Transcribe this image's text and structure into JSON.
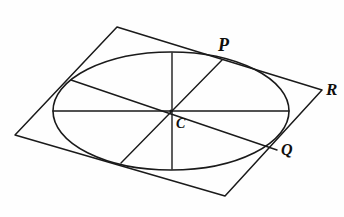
{
  "figure": {
    "kind": "geometry-diagram",
    "background_color": "#fefefe",
    "ink_color": "#1a1a1a",
    "labels": [
      {
        "id": "P",
        "text": "P",
        "role": "point-on-ellipse",
        "x": 222,
        "y": 60
      },
      {
        "id": "R",
        "text": "R",
        "role": "parallelogram-vertex",
        "x": 322,
        "y": 90
      },
      {
        "id": "Q",
        "text": "Q",
        "role": "point-on-ellipse",
        "x": 277,
        "y": 150
      },
      {
        "id": "C",
        "text": "C",
        "role": "ellipse-centre",
        "x": 171,
        "y": 111
      }
    ],
    "parallelogram": {
      "name": "circumscribing-parallelogram",
      "vertices": [
        {
          "x": 117,
          "y": 27
        },
        {
          "x": 322,
          "y": 90
        },
        {
          "x": 225,
          "y": 196
        },
        {
          "x": 15,
          "y": 135
        }
      ]
    },
    "ellipse": {
      "name": "inscribed-ellipse",
      "cx": 171,
      "cy": 111,
      "rx": 118,
      "ry": 59
    },
    "diameters": [
      {
        "name": "horizontal-diameter",
        "x1": 53,
        "y1": 111,
        "x2": 289,
        "y2": 111
      },
      {
        "name": "vertical-diameter",
        "x1": 172,
        "y1": 53,
        "x2": 172,
        "y2": 169
      },
      {
        "name": "diameter-through-P",
        "x1": 222,
        "y1": 60,
        "x2": 121,
        "y2": 163
      },
      {
        "name": "diameter-through-Q",
        "x1": 71,
        "y1": 80,
        "x2": 277,
        "y2": 150
      }
    ]
  }
}
